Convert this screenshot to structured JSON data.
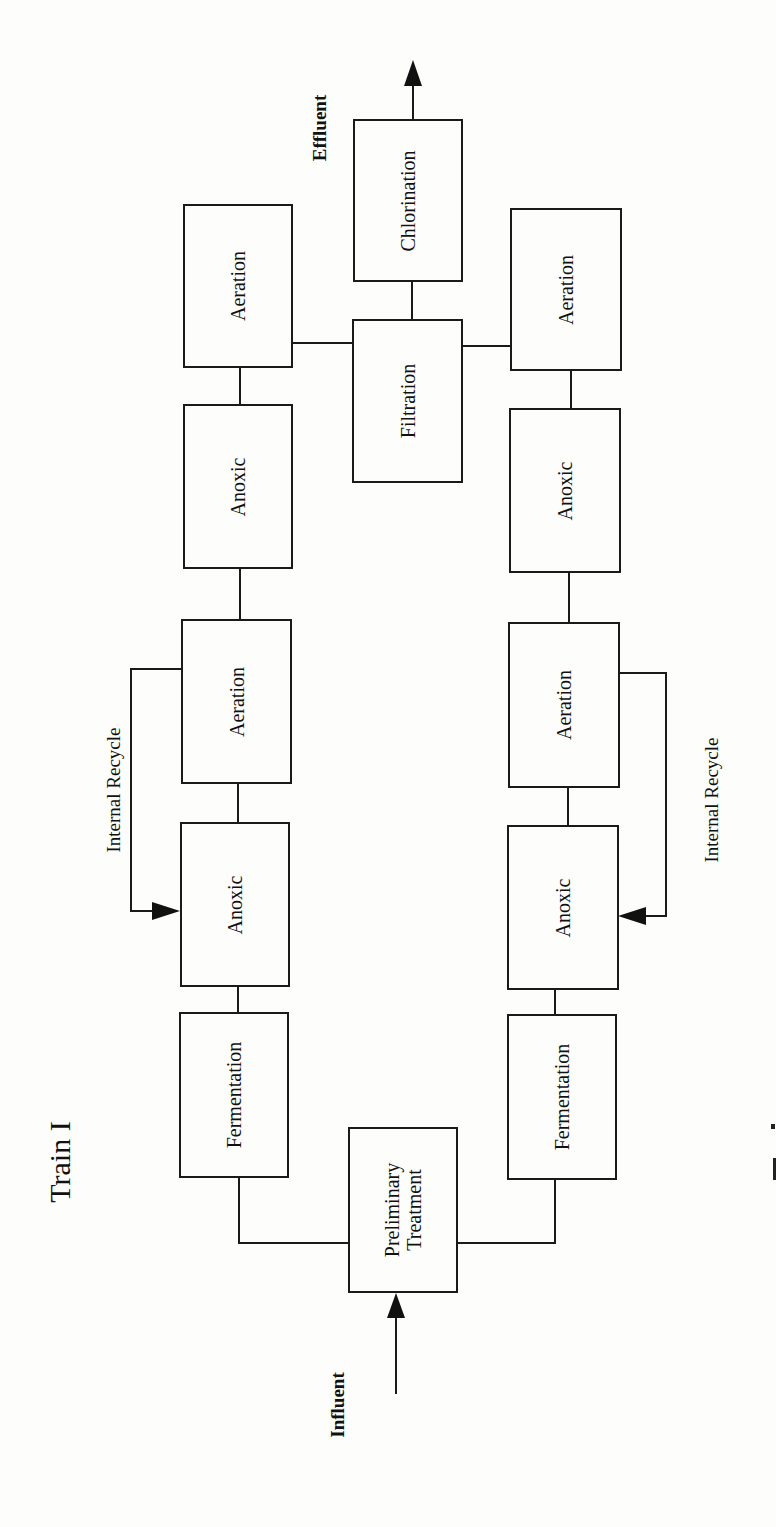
{
  "diagram": {
    "title": "Train I",
    "labels": {
      "influent": "Influent",
      "effluent": "Effluent",
      "recycle_left": "Internal Recycle",
      "recycle_right": "Internal Recycle"
    },
    "left_column": [
      {
        "id": "ferm-left",
        "label": "Fermentation"
      },
      {
        "id": "anoxic-left-1",
        "label": "Anoxic"
      },
      {
        "id": "aeration-left-1",
        "label": "Aeration"
      },
      {
        "id": "anoxic-left-2",
        "label": "Anoxic"
      },
      {
        "id": "aeration-left-2",
        "label": "Aeration"
      }
    ],
    "right_column": [
      {
        "id": "ferm-right",
        "label": "Fermentation"
      },
      {
        "id": "anoxic-right-1",
        "label": "Anoxic"
      },
      {
        "id": "aeration-right-1",
        "label": "Aeration"
      },
      {
        "id": "anoxic-right-2",
        "label": "Anoxic"
      },
      {
        "id": "aeration-right-2",
        "label": "Aeration"
      }
    ],
    "center_column": [
      {
        "id": "preliminary",
        "label_line1": "Preliminary",
        "label_line2": "Treatment"
      },
      {
        "id": "filtration",
        "label": "Filtration"
      },
      {
        "id": "chlorination",
        "label": "Chlorination"
      }
    ]
  }
}
